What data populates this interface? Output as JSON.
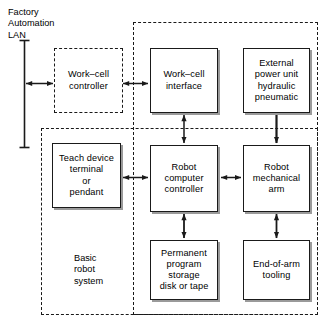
{
  "diagram": {
    "title_label": "Factory\nAutomation\nLAN",
    "basic_system_label": "Basic\nrobot\nsystem",
    "nodes": [
      {
        "id": "work-cell-controller",
        "label": "Work–cell\ncontroller",
        "style": "dashed"
      },
      {
        "id": "work-cell-interface",
        "label": "Work–cell\ninterface",
        "style": "solid"
      },
      {
        "id": "external-power-unit",
        "label": "External\npower unit\nhydraulic\npneumatic",
        "style": "solid"
      },
      {
        "id": "teach-device",
        "label": "Teach device\nterminal\nor\npendant",
        "style": "solid"
      },
      {
        "id": "robot-computer-controller",
        "label": "Robot\ncomputer\ncontroller",
        "style": "solid"
      },
      {
        "id": "robot-mechanical-arm",
        "label": "Robot\nmechanical\narm",
        "style": "solid"
      },
      {
        "id": "permanent-program-storage",
        "label": "Permanent\nprogram\nstorage\ndisk or tape",
        "style": "solid"
      },
      {
        "id": "end-of-arm-tooling",
        "label": "End-of-arm\ntooling",
        "style": "solid"
      }
    ],
    "connections": [
      {
        "from": "factory-automation-lan-bus",
        "to": "work-cell-controller",
        "type": "bidirectional"
      },
      {
        "from": "work-cell-controller",
        "to": "work-cell-interface",
        "type": "bidirectional"
      },
      {
        "from": "work-cell-interface",
        "to": "robot-computer-controller",
        "type": "bidirectional"
      },
      {
        "from": "external-power-unit",
        "to": "robot-mechanical-arm",
        "type": "unidirectional"
      },
      {
        "from": "teach-device",
        "to": "robot-computer-controller",
        "type": "bidirectional"
      },
      {
        "from": "robot-computer-controller",
        "to": "robot-mechanical-arm",
        "type": "bidirectional"
      },
      {
        "from": "robot-computer-controller",
        "to": "permanent-program-storage",
        "type": "bidirectional"
      },
      {
        "from": "robot-mechanical-arm",
        "to": "end-of-arm-tooling",
        "type": "bidirectional"
      }
    ],
    "regions": [
      {
        "id": "work-cell-region",
        "label": ""
      },
      {
        "id": "basic-robot-system-region",
        "label": "Basic robot system"
      }
    ],
    "colors": {
      "line": "#1a1a1a",
      "background": "#ffffff",
      "shadow": "#9a9a9a"
    }
  }
}
